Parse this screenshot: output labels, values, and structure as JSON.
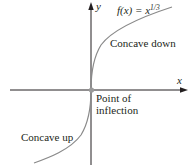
{
  "figure": {
    "function_label": "f(x) = x^(1/3)",
    "function_parts": {
      "fx": "f(x) = x",
      "exponent": "1/3"
    },
    "axis_x_label": "x",
    "axis_y_label": "y",
    "region_upper_label": "Concave down",
    "region_lower_label": "Concave up",
    "point_label_line1": "Point of",
    "point_label_line2": "inflection",
    "colors": {
      "axes": "#231f20",
      "curve": "#8a8a8a",
      "point": "#9a9a9a",
      "text": "#231f20"
    }
  }
}
